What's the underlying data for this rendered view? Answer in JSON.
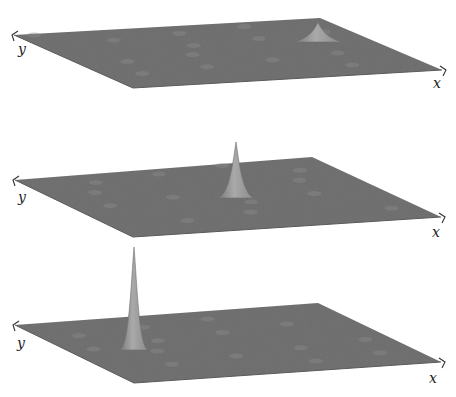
{
  "chart_data": [
    {
      "type": "surface",
      "title": "",
      "xlabel": "x",
      "ylabel": "y",
      "grid": false,
      "peak": {
        "position_x_frac": 0.78,
        "position_y_frac": 0.28,
        "relative_height": 0.22,
        "width": "broad"
      },
      "description": "Noisy flat surface with a low, broad bump near the back-right"
    },
    {
      "type": "surface",
      "title": "",
      "xlabel": "x",
      "ylabel": "y",
      "grid": false,
      "peak": {
        "position_x_frac": 0.62,
        "position_y_frac": 0.45,
        "relative_height": 0.55,
        "width": "medium"
      },
      "description": "Noisy flat surface with a medium-height peak near the center"
    },
    {
      "type": "surface",
      "title": "",
      "xlabel": "x",
      "ylabel": "y",
      "grid": false,
      "peak": {
        "position_x_frac": 0.38,
        "position_y_frac": 0.62,
        "relative_height": 1.0,
        "width": "narrow"
      },
      "description": "Noisy flat surface with a tall, narrow spike toward the front-left"
    }
  ],
  "plots": [
    {
      "x_label": "x",
      "y_label": "y",
      "corners": {
        "left": [
          14,
          35
        ],
        "back": [
          320,
          18
        ],
        "right": [
          442,
          70
        ],
        "front": [
          133,
          88
        ]
      },
      "peak": {
        "base_x": 318,
        "base_y": 42,
        "apex_x": 318,
        "apex_y": 22,
        "half_width": 24
      },
      "colors": {
        "surface": "#6f6f6f",
        "peak": "#9a9a9a"
      }
    },
    {
      "x_label": "x",
      "y_label": "y",
      "corners": {
        "left": [
          15,
          180
        ],
        "back": [
          312,
          157
        ],
        "right": [
          441,
          217
        ],
        "front": [
          133,
          237
        ]
      },
      "peak": {
        "base_x": 236,
        "base_y": 198,
        "apex_x": 236,
        "apex_y": 142,
        "half_width": 18
      },
      "colors": {
        "surface": "#6f6f6f",
        "peak": "#9c9c9c"
      }
    },
    {
      "x_label": "x",
      "y_label": "y",
      "corners": {
        "left": [
          15,
          325
        ],
        "back": [
          318,
          303
        ],
        "right": [
          441,
          362
        ],
        "front": [
          134,
          383
        ]
      },
      "peak": {
        "base_x": 134,
        "base_y": 350,
        "apex_x": 134,
        "apex_y": 247,
        "half_width": 14
      },
      "colors": {
        "surface": "#6f6f6f",
        "peak": "#a0a0a0"
      }
    }
  ]
}
